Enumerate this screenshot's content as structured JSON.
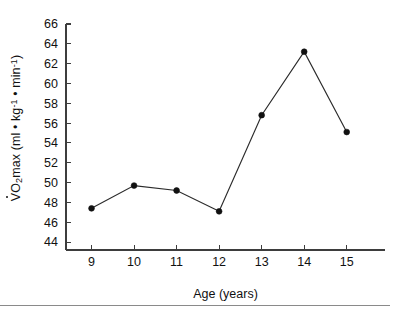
{
  "figure": {
    "background_color": "#ffffff",
    "line_color": "#2b2b2b",
    "axis_color": "#3d3d3d",
    "footer_rule_color": "#8a8a8a"
  },
  "axis_labels": {
    "x_title": "Age (years)",
    "y_title_prefix": "V",
    "y_title_o": "O",
    "y_title_sub2": "2",
    "y_title_max": "max (ml ",
    "y_title_bullet1": "•",
    "y_title_kg": " kg",
    "y_title_kgsup": "-1",
    "y_title_bullet2": " • ",
    "y_title_min": "min",
    "y_title_minsup": "-1",
    "y_title_close": ")",
    "y_title_plain": "VO2 max (ml • kg-1 • min-1)"
  },
  "chart_data": {
    "type": "line",
    "title": "",
    "xlabel": "Age (years)",
    "ylabel": "VO2 max (ml • kg-1 • min-1)",
    "x": [
      9,
      10,
      11,
      12,
      13,
      14,
      15
    ],
    "values": [
      47.4,
      49.7,
      49.2,
      47.1,
      56.8,
      63.2,
      55.1
    ],
    "series": [
      {
        "name": "VO2 max",
        "values": [
          47.4,
          49.7,
          49.2,
          47.1,
          56.8,
          63.2,
          55.1
        ]
      }
    ],
    "xlim": [
      8.4,
      15.9
    ],
    "ylim": [
      43.2,
      66.4
    ],
    "xticks": [
      9,
      10,
      11,
      12,
      13,
      14,
      15
    ],
    "xtick_labels": [
      "9",
      "10",
      "11",
      "12",
      "13",
      "14",
      "15"
    ],
    "yticks": [
      44,
      46,
      48,
      50,
      52,
      54,
      56,
      58,
      60,
      62,
      64,
      66
    ],
    "ytick_labels": [
      "44",
      "46",
      "48",
      "50",
      "52",
      "54",
      "56",
      "58",
      "60",
      "62",
      "64",
      "66"
    ],
    "grid": false,
    "legend": false,
    "marker": "circle",
    "marker_color": "#111111"
  }
}
